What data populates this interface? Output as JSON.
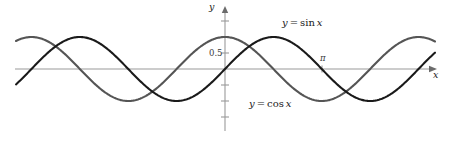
{
  "figure": {
    "title": "",
    "background_color": "#ffffff",
    "width": 449,
    "height": 142
  },
  "axes": {
    "y_axis_label": "y",
    "x_axis_label": "x",
    "y_tick_label": "0.5",
    "x_tick_label": "π",
    "axis_color": "#9a9a9a",
    "tick_color": "#9a9a9a",
    "origin_px": {
      "x": 225,
      "y": 69
    }
  },
  "labels": {
    "sin_var": "y",
    "sin_equals": "=",
    "sin_fn": "sin",
    "sin_arg": "x",
    "sin_full": "y = sin x",
    "cos_var": "y",
    "cos_equals": "=",
    "cos_fn": "cos",
    "cos_arg": "x",
    "cos_full": "y = cos x"
  },
  "chart_data": {
    "type": "line",
    "title": "",
    "xlabel": "x",
    "ylabel": "y",
    "xlim": [
      -3.35,
      6.85
    ],
    "ylim": [
      -1.55,
      1.55
    ],
    "grid": false,
    "legend": "inline-annotations",
    "x_ticks": [
      3.14159
    ],
    "x_tick_labels": [
      "π"
    ],
    "y_ticks": [
      0.5
    ],
    "y_tick_labels": [
      "0.5"
    ],
    "series": [
      {
        "name": "y = sin x",
        "color": "#1a1a1a",
        "linewidth": 2.1,
        "amplitude": 1,
        "period": 6.28319,
        "phase": 0,
        "label_position": {
          "x": 282,
          "y": 18
        },
        "x": [
          -3.35,
          -3.0,
          -2.5,
          -2.0,
          -1.5708,
          -1.0,
          -0.5,
          0,
          0.5,
          1.0,
          1.5708,
          2.0,
          2.5,
          3.14159,
          3.5,
          4.0,
          4.71239,
          5.0,
          5.5,
          6.0,
          6.28319,
          6.85
        ],
        "values": [
          0.2051,
          0.1411,
          0.5985,
          0.9093,
          1.0,
          0.8415,
          0.4794,
          0.0,
          -0.4794,
          -0.8415,
          -1.0,
          -0.9093,
          -0.5985,
          0.0,
          0.3508,
          0.7568,
          1.0,
          0.9589,
          0.7055,
          0.2794,
          0.0,
          -0.5577
        ]
      },
      {
        "name": "y = cos x",
        "color": "#555555",
        "linewidth": 2.1,
        "amplitude": 1,
        "period": 6.28319,
        "phase": 1.5708,
        "label_position": {
          "x": 249,
          "y": 99
        },
        "x": [
          -3.35,
          -3.0,
          -2.5,
          -2.0,
          -1.5708,
          -1.0,
          -0.5,
          0,
          0.5,
          1.0,
          1.5708,
          2.0,
          2.5,
          3.14159,
          3.5,
          4.0,
          4.71239,
          5.0,
          5.5,
          6.0,
          6.28319,
          6.85
        ],
        "values": [
          -0.9787,
          -0.99,
          -0.8011,
          -0.4161,
          0.0,
          0.5403,
          0.8776,
          1.0,
          0.8776,
          0.5403,
          0.0,
          -0.4161,
          -0.8011,
          -1.0,
          -0.9365,
          -0.6536,
          0.0,
          0.2837,
          0.7087,
          0.9602,
          1.0,
          0.83
        ]
      }
    ]
  },
  "render": {
    "px_per_x_unit": 30.8,
    "px_per_y_unit": 32.0,
    "curve_x_start_px": 16,
    "curve_x_end_px": 435
  }
}
